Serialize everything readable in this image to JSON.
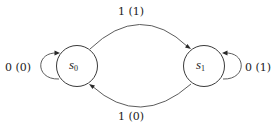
{
  "diagram": {
    "type": "finite-state-machine",
    "states": [
      {
        "id": "s0",
        "name": "s",
        "subscript": "0"
      },
      {
        "id": "s1",
        "name": "s",
        "subscript": "1"
      }
    ],
    "transitions": [
      {
        "from": "s0",
        "to": "s0",
        "label": "0 (0)"
      },
      {
        "from": "s0",
        "to": "s1",
        "label": "1 (1)"
      },
      {
        "from": "s1",
        "to": "s1",
        "label": "0 (1)"
      },
      {
        "from": "s1",
        "to": "s0",
        "label": "1 (0)"
      }
    ],
    "colors": {
      "stroke": "#3a3a3a",
      "text": "#222222",
      "background": "#ffffff"
    }
  }
}
